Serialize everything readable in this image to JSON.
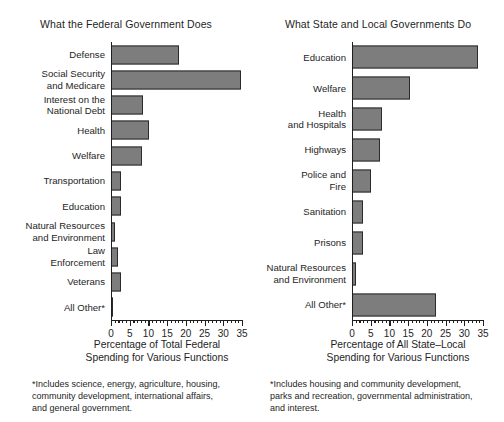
{
  "chart_data": [
    {
      "type": "bar",
      "orientation": "horizontal",
      "title": "What the Federal Government Does",
      "xlabel": "Percentage of Total Federal\nSpending for Various Functions",
      "ylabel": "",
      "xlim": [
        0,
        35
      ],
      "grid": false,
      "legend": "none",
      "xticks": [
        0,
        5,
        10,
        15,
        20,
        25,
        30,
        35
      ],
      "xticklabels": [
        "0",
        "5",
        "10",
        "15",
        "20",
        "25",
        "30",
        "35"
      ],
      "minor_tick_step": 1,
      "bar_color": "#7d7d7d",
      "bar_edge_color": "#2b2b2b",
      "categories": [
        "Defense",
        "Social Security\nand Medicare",
        "Interest on the\nNational Debt",
        "Health",
        "Welfare",
        "Transportation",
        "Education",
        "Natural Resources\nand Environment",
        "Law\nEnforcement",
        "Veterans",
        "All Other*"
      ],
      "values": [
        18.2,
        34.8,
        8.6,
        10.2,
        8.3,
        2.6,
        2.6,
        1.0,
        1.8,
        2.8,
        0.6
      ],
      "footnote": "*Includes science, energy, agriculture, housing,\ncommunity development, international affairs,\nand general government."
    },
    {
      "type": "bar",
      "orientation": "horizontal",
      "title": "What State and Local Governments Do",
      "xlabel": "Percentage of All State–Local\nSpending for Various Functions",
      "ylabel": "",
      "xlim": [
        0,
        35
      ],
      "grid": false,
      "legend": "none",
      "xticks": [
        0,
        5,
        10,
        15,
        20,
        25,
        30,
        35
      ],
      "xticklabels": [
        "0",
        "5",
        "10",
        "15",
        "20",
        "25",
        "30",
        "35"
      ],
      "minor_tick_step": 1,
      "bar_color": "#7d7d7d",
      "bar_edge_color": "#2b2b2b",
      "categories": [
        "Education",
        "Welfare",
        "Health\nand Hospitals",
        "Highways",
        "Police and\nFire",
        "Sanitation",
        "Prisons",
        "Natural Resources\nand Environment",
        "All Other*"
      ],
      "values": [
        33.7,
        15.5,
        8.0,
        7.5,
        5.0,
        3.0,
        3.0,
        1.0,
        22.5
      ],
      "footnote": "*Includes housing and community development,\nparks and recreation, governmental administration,\nand  interest."
    }
  ]
}
